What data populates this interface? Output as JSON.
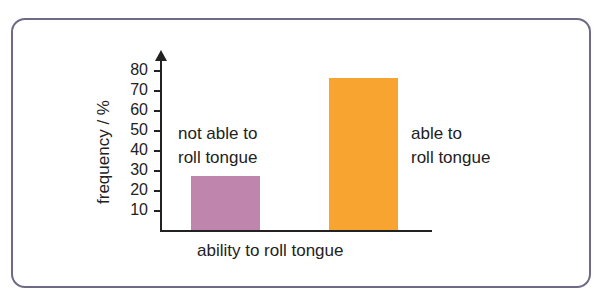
{
  "chart_data": {
    "type": "bar",
    "title": "",
    "xlabel": "ability to roll tongue",
    "ylabel": "frequency / %",
    "categories": [
      "not able to roll tongue",
      "able to roll tongue"
    ],
    "values": [
      27,
      76
    ],
    "colors": [
      "#bf85ad",
      "#f7a530"
    ],
    "ylim": [
      0,
      85
    ],
    "yticks": [
      10,
      20,
      30,
      40,
      50,
      60,
      70,
      80
    ],
    "grid": false,
    "legend": null,
    "annotations": [
      {
        "text_line1": "not able to",
        "text_line2": "roll tongue"
      },
      {
        "text_line1": "able to",
        "text_line2": "roll tongue"
      }
    ]
  },
  "frame_color": "#6e6a86"
}
